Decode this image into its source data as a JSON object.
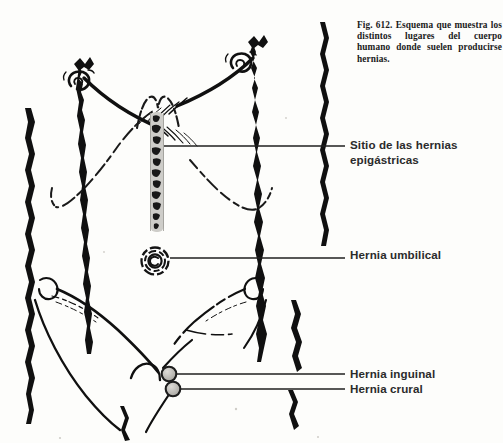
{
  "figure": {
    "title_id": "Fig. 612.",
    "caption": "Fig. 612.  Esquema que muestra los distintos lugares del cuerpo humano donde suelen producirse hernias.",
    "background_color": "#fdfdfb",
    "ink_color": "#111111",
    "marker_fill_color": "#b9b7b2",
    "label_color": "#2b2b2b"
  },
  "labels": {
    "epigastric": "Sitio de las hernias\nepigástricas",
    "umbilical": "Hernia umbilical",
    "inguinal": "Hernia inguinal",
    "crural": "Hernia crural"
  },
  "markers": {
    "epigastric": {
      "kind": "stippled-vertical-band",
      "x": 157,
      "y_top": 112,
      "y_bottom": 232,
      "width": 13
    },
    "umbilical": {
      "kind": "concentric-spiral-circle",
      "cx": 155,
      "cy": 261,
      "r": 14
    },
    "inguinal": {
      "kind": "filled-circle",
      "cx": 169,
      "cy": 374,
      "r": 7
    },
    "crural": {
      "kind": "filled-circle",
      "cx": 173,
      "cy": 389,
      "r": 7
    }
  },
  "leader_lines": {
    "epigastric": {
      "x1": 164,
      "y1": 146,
      "x2": 345,
      "y2": 146
    },
    "umbilical": {
      "x1": 170,
      "y1": 258,
      "x2": 345,
      "y2": 258
    },
    "inguinal": {
      "x1": 176,
      "y1": 374,
      "x2": 345,
      "y2": 374
    },
    "crural": {
      "x1": 180,
      "y1": 389,
      "x2": 345,
      "y2": 389
    }
  }
}
